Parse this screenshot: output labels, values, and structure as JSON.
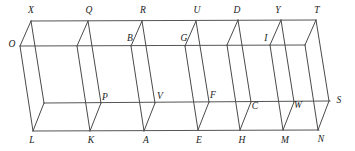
{
  "figure": {
    "type": "parallel-projection-solid",
    "canvas": {
      "width": 355,
      "height": 151
    },
    "stroke_color": "#4a4a4a",
    "rail_color": "#555555",
    "label_color": "#1a1a1a",
    "background_color": "#ffffff"
  },
  "geometry": {
    "rails": [
      {
        "name": "top-back-rail",
        "x1": 31,
        "y1": 21,
        "x2": 316,
        "y2": 20
      },
      {
        "name": "top-front-rail",
        "x1": 20,
        "y1": 46,
        "x2": 305,
        "y2": 45
      },
      {
        "name": "bottom-back-rail",
        "x1": 44,
        "y1": 103,
        "x2": 330,
        "y2": 101
      },
      {
        "name": "bottom-front-rail",
        "x1": 33,
        "y1": 131,
        "x2": 319,
        "y2": 130
      }
    ],
    "ribs": [
      {
        "name": "rib-X-L",
        "top": [
          31,
          21
        ],
        "mid": [
          20,
          46
        ],
        "lower": [
          44,
          103
        ],
        "bottom": [
          33,
          131
        ]
      },
      {
        "name": "rib-Q-K",
        "top": [
          88,
          21
        ],
        "mid": [
          77,
          46
        ],
        "lower": [
          101,
          103
        ],
        "bottom": [
          90,
          131
        ]
      },
      {
        "name": "rib-R-A",
        "top": [
          142,
          21
        ],
        "mid": [
          131,
          46
        ],
        "lower": [
          155,
          103
        ],
        "bottom": [
          144,
          131
        ]
      },
      {
        "name": "rib-U-E",
        "top": [
          196,
          21
        ],
        "mid": [
          185,
          46
        ],
        "lower": [
          209,
          102
        ],
        "bottom": [
          198,
          130
        ]
      },
      {
        "name": "rib-D-H",
        "top": [
          238,
          20
        ],
        "mid": [
          227,
          45
        ],
        "lower": [
          251,
          102
        ],
        "bottom": [
          240,
          130
        ]
      },
      {
        "name": "rib-Y-M",
        "top": [
          281,
          20
        ],
        "mid": [
          270,
          45
        ],
        "lower": [
          294,
          102
        ],
        "bottom": [
          283,
          130
        ]
      },
      {
        "name": "rib-T-N",
        "top": [
          316,
          20
        ],
        "mid": [
          305,
          45
        ],
        "lower": [
          329,
          101
        ],
        "bottom": [
          318,
          130
        ]
      }
    ]
  },
  "labels": {
    "vertices": [
      {
        "id": "X",
        "text": "X",
        "x": 31,
        "y": 11,
        "anchor": "top-back-left"
      },
      {
        "id": "Q",
        "text": "Q",
        "x": 89,
        "y": 11,
        "anchor": "top-back"
      },
      {
        "id": "R",
        "text": "R",
        "x": 143,
        "y": 11,
        "anchor": "top-back"
      },
      {
        "id": "U",
        "text": "U",
        "x": 197,
        "y": 11,
        "anchor": "top-back"
      },
      {
        "id": "D",
        "text": "D",
        "x": 237,
        "y": 11,
        "anchor": "top-back"
      },
      {
        "id": "Y",
        "text": "Y",
        "x": 278,
        "y": 11,
        "anchor": "top-back"
      },
      {
        "id": "T",
        "text": "T",
        "x": 317,
        "y": 11,
        "anchor": "top-back-right"
      },
      {
        "id": "O",
        "text": "O",
        "x": 12,
        "y": 45,
        "anchor": "top-front-left"
      },
      {
        "id": "B",
        "text": "B",
        "x": 130,
        "y": 39,
        "anchor": "top-front"
      },
      {
        "id": "G",
        "text": "G",
        "x": 184,
        "y": 39,
        "anchor": "top-front"
      },
      {
        "id": "I",
        "text": "I",
        "x": 266,
        "y": 39,
        "anchor": "top-front"
      },
      {
        "id": "P",
        "text": "P",
        "x": 105,
        "y": 98,
        "anchor": "bottom-back"
      },
      {
        "id": "V",
        "text": "V",
        "x": 160,
        "y": 97,
        "anchor": "bottom-back"
      },
      {
        "id": "F",
        "text": "F",
        "x": 213,
        "y": 96,
        "anchor": "bottom-back"
      },
      {
        "id": "C",
        "text": "C",
        "x": 255,
        "y": 107,
        "anchor": "bottom-back"
      },
      {
        "id": "W",
        "text": "W",
        "x": 298,
        "y": 106,
        "anchor": "bottom-back"
      },
      {
        "id": "S",
        "text": "S",
        "x": 339,
        "y": 101,
        "anchor": "bottom-back-right"
      },
      {
        "id": "L",
        "text": "L",
        "x": 32,
        "y": 141,
        "anchor": "bottom-front-left"
      },
      {
        "id": "K",
        "text": "K",
        "x": 91,
        "y": 141,
        "anchor": "bottom-front"
      },
      {
        "id": "A",
        "text": "A",
        "x": 146,
        "y": 141,
        "anchor": "bottom-front"
      },
      {
        "id": "E",
        "text": "E",
        "x": 199,
        "y": 141,
        "anchor": "bottom-front"
      },
      {
        "id": "H",
        "text": "H",
        "x": 242,
        "y": 141,
        "anchor": "bottom-front"
      },
      {
        "id": "M",
        "text": "M",
        "x": 285,
        "y": 141,
        "anchor": "bottom-front"
      },
      {
        "id": "N",
        "text": "N",
        "x": 321,
        "y": 140,
        "anchor": "bottom-front-right"
      }
    ]
  }
}
